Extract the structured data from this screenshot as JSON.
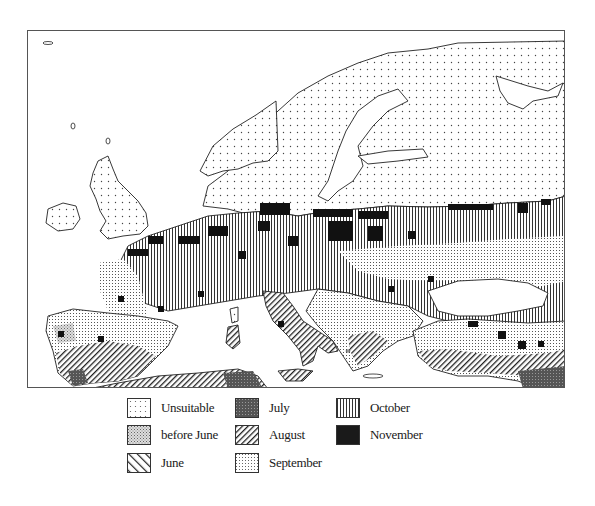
{
  "figure": {
    "type": "thematic-map",
    "region": "Europe",
    "frame": {
      "x": 27,
      "y": 30,
      "width": 538,
      "height": 358
    }
  },
  "legend": {
    "items": [
      {
        "key": "unsuitable",
        "label": "Unsuitable",
        "pattern": "sparse-dots"
      },
      {
        "key": "before_june",
        "label": "before June",
        "pattern": "dense-stipple"
      },
      {
        "key": "june",
        "label": "June",
        "pattern": "wide-diagonal-backslash"
      },
      {
        "key": "july",
        "label": "July",
        "pattern": "dark-stipple"
      },
      {
        "key": "august",
        "label": "August",
        "pattern": "fine-diagonal-slash"
      },
      {
        "key": "september",
        "label": "September",
        "pattern": "grid-dots"
      },
      {
        "key": "october",
        "label": "October",
        "pattern": "vertical-lines"
      },
      {
        "key": "november",
        "label": "November",
        "pattern": "solid-black"
      }
    ]
  },
  "colors": {
    "ink": "#1a1a1a",
    "paper": "#ffffff",
    "frame": "#555555"
  }
}
